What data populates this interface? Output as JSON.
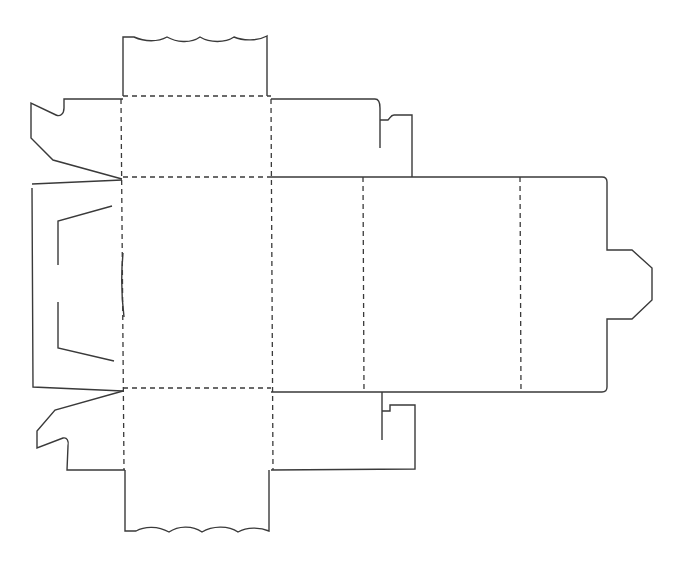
{
  "diagram": {
    "type": "box-dieline",
    "line_styles": {
      "cut": {
        "color": "#3a3a3a",
        "style": "solid"
      },
      "fold": {
        "color": "#3a3a3a",
        "style": "dashed"
      }
    },
    "panels": [
      {
        "name": "top-tuck-flap",
        "type": "flap"
      },
      {
        "name": "top-panel",
        "type": "panel"
      },
      {
        "name": "front-panel",
        "type": "panel"
      },
      {
        "name": "bottom-panel",
        "type": "panel"
      },
      {
        "name": "bottom-tuck-flap",
        "type": "flap"
      },
      {
        "name": "left-dust-flap-upper",
        "type": "flap"
      },
      {
        "name": "left-dust-flap-lower",
        "type": "flap"
      },
      {
        "name": "left-side-panel",
        "type": "panel"
      },
      {
        "name": "right-dust-flap-upper",
        "type": "flap"
      },
      {
        "name": "right-dust-flap-lower",
        "type": "flap"
      },
      {
        "name": "side-panel-1",
        "type": "panel"
      },
      {
        "name": "back-panel",
        "type": "panel"
      },
      {
        "name": "side-panel-2",
        "type": "panel"
      },
      {
        "name": "glue-tab",
        "type": "tab"
      }
    ]
  }
}
